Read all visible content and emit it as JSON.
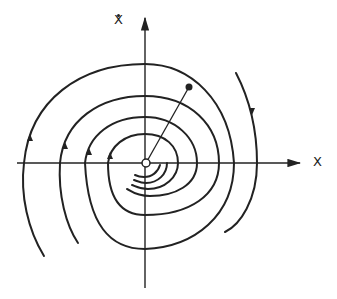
{
  "diagram": {
    "type": "phase-portrait",
    "axes": {
      "x_label": "X",
      "y_label": "Ẋ",
      "y_label_base": "X",
      "origin": [
        146,
        163
      ]
    },
    "elements": {
      "origin_marker": "open-circle",
      "state_point": "filled-dot",
      "radius_line": "line from origin to state point"
    },
    "colors": {
      "stroke": "#222222",
      "background": "#ffffff"
    }
  }
}
